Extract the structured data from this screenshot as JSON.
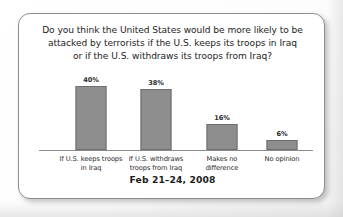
{
  "card": {
    "question_lines": [
      "Do you think the United States would be more likely to be",
      "attacked by terrorists if the U.S. keeps its troops in Iraq",
      "or if the U.S. withdraws its troops from Iraq?"
    ],
    "footer_date": "Feb 21–24, 2008"
  },
  "chart_data": {
    "type": "bar",
    "title": "Do you think the United States would be more likely to be attacked by terrorists if the U.S. keeps its troops in Iraq or if the U.S. withdraws its troops from Iraq?",
    "subtitle": "Feb 21–24, 2008",
    "xlabel": "",
    "ylabel": "",
    "ylim": [
      0,
      45
    ],
    "grid": false,
    "legend": "none",
    "unit": "%",
    "categories": [
      "If U.S. keeps troops in Iraq",
      "If U.S. withdraws troops from Iraq",
      "Makes no difference",
      "No opinion"
    ],
    "category_lines": [
      [
        "If U.S. keeps troops",
        "in Iraq"
      ],
      [
        "If U.S. withdraws",
        "troops from Iraq"
      ],
      [
        "Makes no",
        "difference"
      ],
      [
        "No opinion"
      ]
    ],
    "values": [
      40,
      38,
      16,
      6
    ],
    "value_labels": [
      "40%",
      "38%",
      "16%",
      "6%"
    ],
    "bar_color": "#8e8e8e",
    "bar_border_color": "#6f6f6f",
    "axis_color": "#8c8c8c"
  }
}
